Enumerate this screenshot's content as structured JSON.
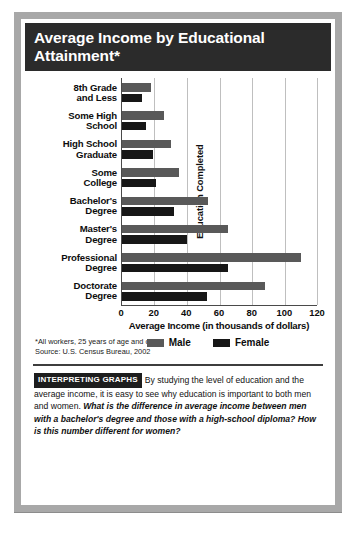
{
  "title": "Average Income by Educational Attainment*",
  "chart_data": {
    "type": "bar",
    "orientation": "horizontal",
    "title": "Average Income by Educational Attainment*",
    "categories": [
      "8th Grade and Less",
      "Some High School",
      "High School Graduate",
      "Some College",
      "Bachelor's Degree",
      "Master's Degree",
      "Professional Degree",
      "Doctorate Degree"
    ],
    "category_lines": [
      [
        "8th Grade",
        "and Less"
      ],
      [
        "Some High",
        "School"
      ],
      [
        "High School",
        "Graduate"
      ],
      [
        "Some",
        "College"
      ],
      [
        "Bachelor's",
        "Degree"
      ],
      [
        "Master's",
        "Degree"
      ],
      [
        "Professional",
        "Degree"
      ],
      [
        "Doctorate",
        "Degree"
      ]
    ],
    "series": [
      {
        "name": "Male",
        "color": "#595959",
        "values": [
          18,
          26,
          30,
          35,
          53,
          65,
          110,
          88
        ]
      },
      {
        "name": "Female",
        "color": "#171717",
        "values": [
          12,
          15,
          19,
          21,
          32,
          40,
          65,
          52
        ]
      }
    ],
    "xlabel": "Average Income (in thousands of dollars)",
    "ylabel": "Education Completed",
    "xlim": [
      0,
      120
    ],
    "xticks": [
      0,
      20,
      40,
      60,
      80,
      100,
      120
    ],
    "xtick_labels": [
      "0",
      "20",
      "40",
      "60",
      "80",
      "100",
      "120"
    ],
    "grid": "vertical",
    "legend_position": "bottom"
  },
  "legend": [
    {
      "label": "Male",
      "color": "#595959"
    },
    {
      "label": "Female",
      "color": "#171717"
    }
  ],
  "footnote": {
    "line1": "*All workers, 25 years of age and older",
    "line2": "Source: U.S. Census Bureau, 2002"
  },
  "interpret": {
    "tag": "INTERPRETING GRAPHS",
    "body": "By studying the level of education and the average income, it is easy to see why education is important to both men and women.",
    "question": "What is the difference in average income between men with a bachelor's degree and those with a high-school diploma? How is this number different for women?"
  }
}
